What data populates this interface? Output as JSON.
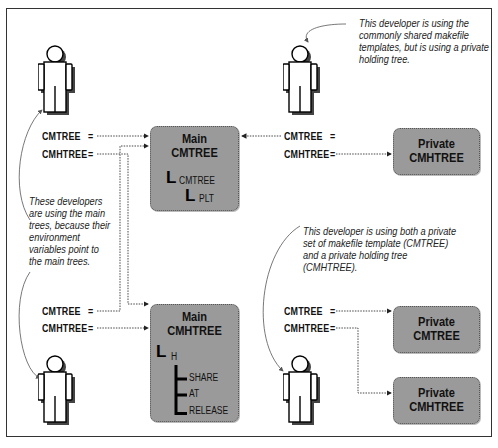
{
  "diagram": {
    "notes": {
      "top_right": "This developer is using the commonly shared makefile templates, but is using a private holding tree.",
      "left": "These developers are using the main trees, because their environment variables point to the main trees.",
      "bottom_right": "This developer is using both a private set of makefile template (CMTREE) and a private holding tree (CMHTREE)."
    },
    "developers": [
      {
        "id": "dev-top-left",
        "vars": [
          {
            "name": "CMTREE",
            "eq": "="
          },
          {
            "name": "CMHTREE",
            "eq": "="
          }
        ]
      },
      {
        "id": "dev-top-right",
        "vars": [
          {
            "name": "CMTREE",
            "eq": "="
          },
          {
            "name": "CMHTREE",
            "eq": "="
          }
        ]
      },
      {
        "id": "dev-bottom-left",
        "vars": [
          {
            "name": "CMTREE",
            "eq": "="
          },
          {
            "name": "CMHTREE",
            "eq": "="
          }
        ]
      },
      {
        "id": "dev-bottom-right",
        "vars": [
          {
            "name": "CMTREE",
            "eq": "="
          },
          {
            "name": "CMHTREE",
            "eq": "="
          }
        ]
      }
    ],
    "boxes": {
      "main_cmtree": {
        "line1": "Main",
        "line2": "CMTREE",
        "tree": [
          "CMTREE",
          "PLT"
        ]
      },
      "main_cmhtree": {
        "line1": "Main",
        "line2": "CMHTREE",
        "tree": [
          "H",
          "SHARE",
          "AT",
          "RELEASE"
        ]
      },
      "private_cmhtree_top": {
        "line1": "Private",
        "line2": "CMHTREE"
      },
      "private_cmtree_bottom": {
        "line1": "Private",
        "line2": "CMTREE"
      },
      "private_cmhtree_bottom": {
        "line1": "Private",
        "line2": "CMHTREE"
      }
    },
    "tree_glyph": "L",
    "colors": {
      "box_fill": "#9a9a9a",
      "line": "#333333",
      "background": "#ffffff"
    }
  }
}
